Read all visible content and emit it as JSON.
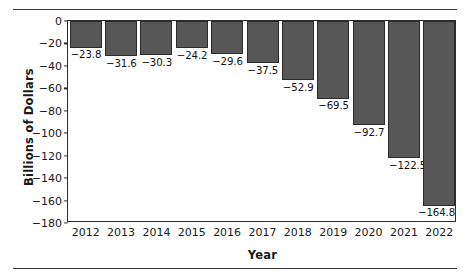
{
  "chart_data": {
    "type": "bar",
    "title": "",
    "subtitle": "",
    "xlabel": "Year",
    "ylabel": "Billions of Dollars",
    "categories": [
      "2012",
      "2013",
      "2014",
      "2015",
      "2016",
      "2017",
      "2018",
      "2019",
      "2020",
      "2021",
      "2022"
    ],
    "values": [
      -23.8,
      -31.6,
      -30.3,
      -24.2,
      -29.6,
      -37.5,
      -52.9,
      -69.5,
      -92.7,
      -122.5,
      -164.8
    ],
    "value_labels": [
      "−23.8",
      "−31.6",
      "−30.3",
      "−24.2",
      "−29.6",
      "−37.5",
      "−52.9",
      "−69.5",
      "−92.7",
      "−122.5",
      "−164.8"
    ],
    "ylim": [
      -180,
      0
    ],
    "ytick_values": [
      0,
      -20,
      -40,
      -60,
      -80,
      -100,
      -120,
      -140,
      -160,
      -180
    ],
    "ytick_labels": [
      "0",
      "−20",
      "−40",
      "−60",
      "−80",
      "−100",
      "−120",
      "−140",
      "−160",
      "−180"
    ],
    "grid": false,
    "legend": null,
    "bar_color": "#575757",
    "bar_edge_color": "#2b2b2b",
    "axis_color": "#2c2c2c",
    "background_color": "#ffffff"
  }
}
